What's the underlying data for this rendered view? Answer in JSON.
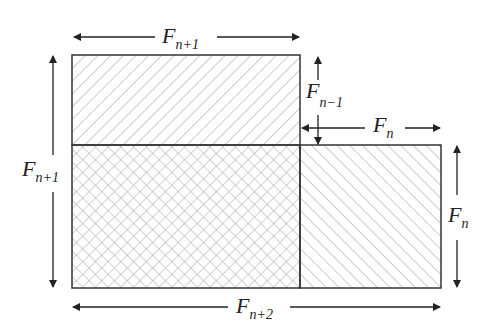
{
  "diagram": {
    "labels": {
      "top": {
        "base": "F",
        "sub": "n+1"
      },
      "left": {
        "base": "F",
        "sub": "n+1"
      },
      "middle_vertical": {
        "base": "F",
        "sub": "n−1"
      },
      "middle_horizontal": {
        "base": "F",
        "sub": "n"
      },
      "right": {
        "base": "F",
        "sub": "n"
      },
      "bottom": {
        "base": "F",
        "sub": "n+2"
      }
    },
    "regions": [
      {
        "name": "top-rectangle",
        "pattern": "diagonal-forward",
        "size": "F(n+1) × F(n-1)"
      },
      {
        "name": "square",
        "pattern": "crosshatch",
        "size": "F(n+1) × F(n+1)"
      },
      {
        "name": "right-rectangle",
        "pattern": "diagonal-backward",
        "size": "F(n) × F(n+1)"
      }
    ],
    "colors": {
      "stroke": "#333333",
      "hatch": "#9a9a9a",
      "background": "#ffffff"
    }
  }
}
